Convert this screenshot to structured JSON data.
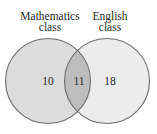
{
  "diagram": {
    "type": "venn",
    "sets": [
      {
        "name": "Mathematics class",
        "label_lines": [
          "Mathematics",
          "class"
        ],
        "only_count": "10",
        "fill": "#dcdcdc"
      },
      {
        "name": "English class",
        "label_lines": [
          "English",
          "class"
        ],
        "only_count": "18",
        "fill": "#ececec"
      }
    ],
    "intersection": {
      "count": "11",
      "fill": "#bdbdbd"
    },
    "stroke": "#6e6e6e"
  }
}
